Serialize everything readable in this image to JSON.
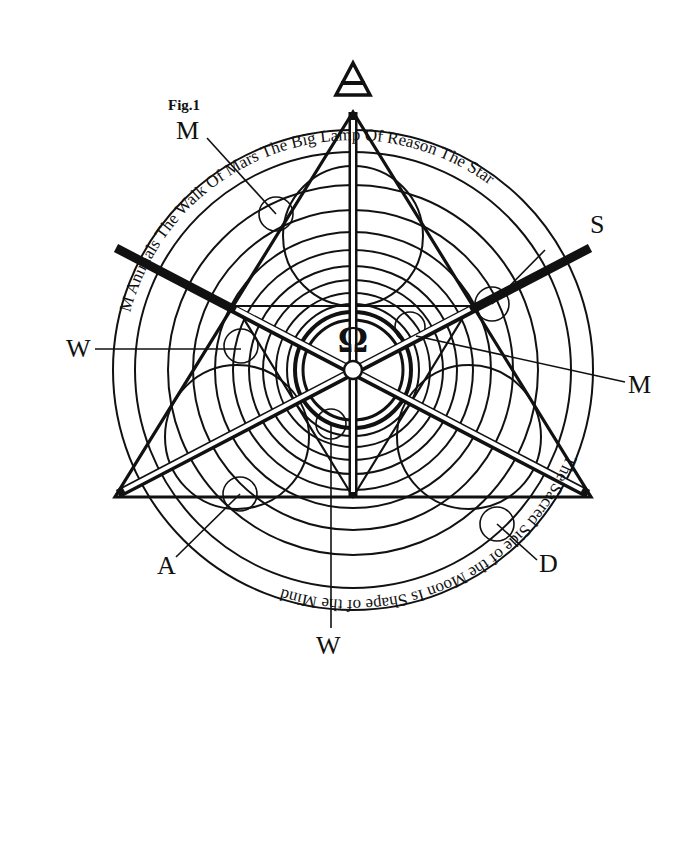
{
  "figure": {
    "caption": "Fig.1",
    "top_symbol": "air-triangle-symbol",
    "center_symbol": "Ω",
    "ring_text_top": "M Animals The Walk Of Mars The Big Lamp Of Reason The Star",
    "ring_text_right": "Big Dome Of Reason The Secrets",
    "ring_text_left": "Wish Of The Walker A Animals",
    "ring_text_bottom": "The Sacred Side of the Moon Is Shape of the Mind",
    "direction_labels": {
      "top_left": "M",
      "right_top": "S",
      "left": "W",
      "right": "M",
      "bottom_left": "A",
      "bottom": "W",
      "bottom_right": "D"
    },
    "colors": {
      "ink": "#111111",
      "paper": "#ffffff"
    }
  }
}
